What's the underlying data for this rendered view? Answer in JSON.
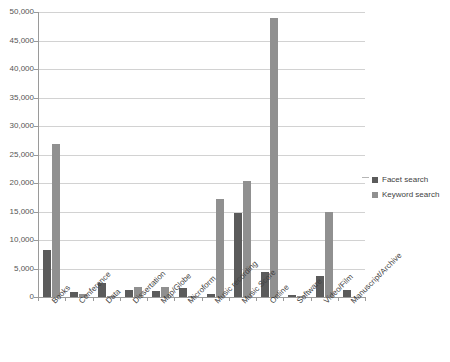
{
  "chart_data": {
    "type": "bar",
    "title": "",
    "xlabel": "",
    "ylabel": "",
    "ylim": [
      0,
      50000
    ],
    "ytick_values": [
      0,
      5000,
      10000,
      15000,
      20000,
      25000,
      30000,
      35000,
      40000,
      45000,
      50000
    ],
    "ytick_labels": [
      "0",
      "5,000",
      "10,000",
      "15,000",
      "20,000",
      "25,000",
      "30,000",
      "35,000",
      "40,000",
      "45,000",
      "50,000"
    ],
    "grid": true,
    "legend_position": "right",
    "categories": [
      "Books",
      "Conference",
      "Data",
      "Dissertation",
      "Map/Globe",
      "Microform",
      "Music recording",
      "Music Score",
      "Online",
      "Software",
      "Video/Film",
      "Manuscript/Archive"
    ],
    "series": [
      {
        "name": "Facet search",
        "color": "#5b5b5b",
        "values": [
          8200,
          900,
          2500,
          1200,
          1000,
          1500,
          600,
          14800,
          4400,
          300,
          3700,
          1300
        ]
      },
      {
        "name": "Keyword search",
        "color": "#909090",
        "values": [
          26900,
          500,
          100,
          1800,
          1700,
          250,
          17200,
          20400,
          49000,
          100,
          15000,
          0
        ]
      }
    ]
  },
  "legend": {
    "items": [
      {
        "label": "Facet search",
        "swatch": "facet"
      },
      {
        "label": "Keyword search",
        "swatch": "keyword"
      }
    ]
  }
}
